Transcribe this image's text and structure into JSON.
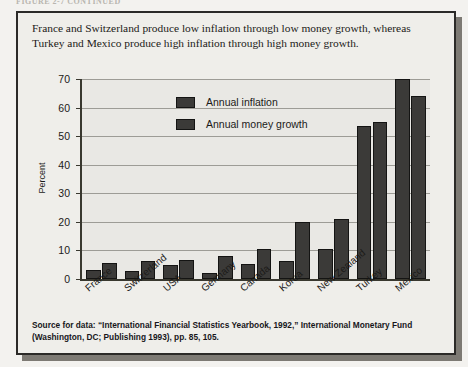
{
  "page": {
    "running_head": "FIGURE 2-7  CONTINUED"
  },
  "caption": "France and Switzerland produce low inflation through low money growth, whereas Turkey and Mexico produce high inflation through high money growth.",
  "source_note": "Source for data: “International Financial Statistics Yearbook, 1992,” International Monetary Fund (Washington, DC; Publishing 1993), pp. 85, 105.",
  "colors": {
    "bar": "#3b3a38",
    "bar_outline": "#141413",
    "plot_background": "#e9e8e4",
    "figure_background": "#efeeea",
    "figure_border": "#2b2a28",
    "gridline": "#9d9c96",
    "axis": "#39382f"
  },
  "chart_data": {
    "type": "bar",
    "title": "",
    "xlabel": "",
    "ylabel": "Percent",
    "ylim": [
      0,
      70
    ],
    "yticks": [
      0,
      10,
      20,
      30,
      40,
      50,
      60,
      70
    ],
    "ytick_labels": [
      "0",
      "10",
      "20",
      "30",
      "40",
      "50",
      "60",
      "70"
    ],
    "grid": true,
    "legend_position": "upper-left-inside",
    "categories": [
      "France",
      "Switzerland",
      "USA",
      "Germany",
      "Canada",
      "Korea",
      "New Zealand",
      "Turkey",
      "Mexico"
    ],
    "series": [
      {
        "name": "Annual inflation",
        "values": [
          3.0,
          2.8,
          5.0,
          2.2,
          5.2,
          6.3,
          10.5,
          53.5,
          70.0
        ]
      },
      {
        "name": "Annual money growth",
        "values": [
          5.5,
          6.3,
          6.5,
          8.0,
          10.5,
          20.0,
          21.0,
          55.0,
          64.0
        ]
      }
    ]
  }
}
